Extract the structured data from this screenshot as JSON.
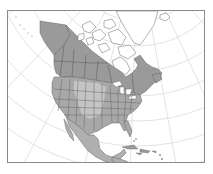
{
  "map": {
    "title": "North America",
    "region": "North America",
    "projection": "conic / azimuthal graticule",
    "colors": {
      "background": "#ffffff",
      "frame": "#8a8a8a",
      "graticule": "#dcdcdc",
      "canada_fill": "#9a9a9a",
      "us_fill": "#a8a8a8",
      "us_light_fill": "#c4c4c4",
      "mexico_fill": "#b0b0b0",
      "arctic_fill": "#ffffff",
      "border": "#555555",
      "coast": "#666666"
    },
    "features": [
      {
        "name": "Alaska",
        "shaded": true
      },
      {
        "name": "Canada",
        "shaded": true
      },
      {
        "name": "Canadian Arctic Archipelago",
        "shaded": false
      },
      {
        "name": "Greenland",
        "shaded": false
      },
      {
        "name": "United States",
        "shaded": true
      },
      {
        "name": "Mexico",
        "shaded": true
      },
      {
        "name": "Central America",
        "shaded": true
      },
      {
        "name": "Caribbean islands",
        "shaded": true
      }
    ]
  }
}
